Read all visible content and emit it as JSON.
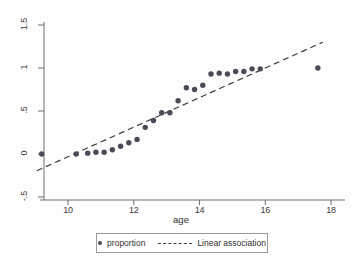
{
  "chart_data": {
    "type": "scatter",
    "title": "",
    "xlabel": "age",
    "ylabel": "",
    "xlim": [
      9.0,
      18.2
    ],
    "ylim": [
      -0.5,
      1.5
    ],
    "grid": false,
    "legend_position": "bottom",
    "x_ticks": [
      10,
      12,
      14,
      16,
      18
    ],
    "x_tick_labels": [
      "10",
      "12",
      "14",
      "16",
      "18"
    ],
    "y_ticks": [
      -0.5,
      0,
      0.5,
      1,
      1.5
    ],
    "y_tick_labels": [
      "-.5",
      "0",
      ".5",
      "1",
      "1.5"
    ],
    "series": [
      {
        "name": "proportion",
        "type": "scatter",
        "marker": "circle",
        "color": "#4a4a58",
        "points": [
          {
            "x": 9.2,
            "y": 0.0
          },
          {
            "x": 10.25,
            "y": 0.0
          },
          {
            "x": 10.6,
            "y": 0.01
          },
          {
            "x": 10.85,
            "y": 0.02
          },
          {
            "x": 11.1,
            "y": 0.02
          },
          {
            "x": 11.35,
            "y": 0.05
          },
          {
            "x": 11.6,
            "y": 0.09
          },
          {
            "x": 11.85,
            "y": 0.13
          },
          {
            "x": 12.1,
            "y": 0.17
          },
          {
            "x": 12.35,
            "y": 0.31
          },
          {
            "x": 12.6,
            "y": 0.39
          },
          {
            "x": 12.85,
            "y": 0.48
          },
          {
            "x": 13.1,
            "y": 0.48
          },
          {
            "x": 13.35,
            "y": 0.62
          },
          {
            "x": 13.6,
            "y": 0.77
          },
          {
            "x": 13.85,
            "y": 0.75
          },
          {
            "x": 14.1,
            "y": 0.8
          },
          {
            "x": 14.35,
            "y": 0.93
          },
          {
            "x": 14.6,
            "y": 0.94
          },
          {
            "x": 14.85,
            "y": 0.93
          },
          {
            "x": 15.1,
            "y": 0.96
          },
          {
            "x": 15.35,
            "y": 0.96
          },
          {
            "x": 15.6,
            "y": 0.99
          },
          {
            "x": 15.85,
            "y": 0.99
          },
          {
            "x": 17.6,
            "y": 1.0
          }
        ]
      },
      {
        "name": "Linear association",
        "type": "line",
        "style": "dashed",
        "color": "#3c3c3c",
        "endpoints": [
          {
            "x": 9.05,
            "y": -0.195
          },
          {
            "x": 17.75,
            "y": 1.3
          }
        ]
      }
    ]
  },
  "legend": {
    "items": [
      {
        "label": "proportion",
        "marker": "circle"
      },
      {
        "label": "Linear association",
        "marker": "dashed-line"
      }
    ]
  },
  "axes": {
    "x_title": "age"
  }
}
